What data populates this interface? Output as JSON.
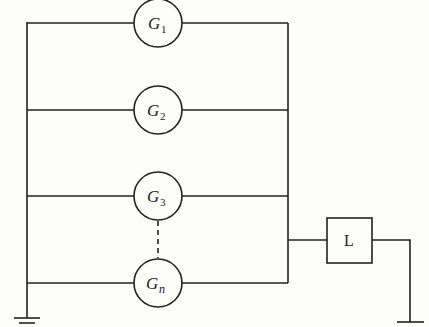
{
  "diagram": {
    "type": "circuit",
    "generators": [
      {
        "label": "G",
        "subscript": "1",
        "y": 23
      },
      {
        "label": "G",
        "subscript": "2",
        "y": 110
      },
      {
        "label": "G",
        "subscript": "3",
        "y": 196
      },
      {
        "label": "G",
        "subscript": "n",
        "y": 283
      }
    ],
    "load": {
      "label": "L"
    },
    "ground_symbols": 2,
    "ellipsis_link": "dashed line between G3 and Gn"
  }
}
